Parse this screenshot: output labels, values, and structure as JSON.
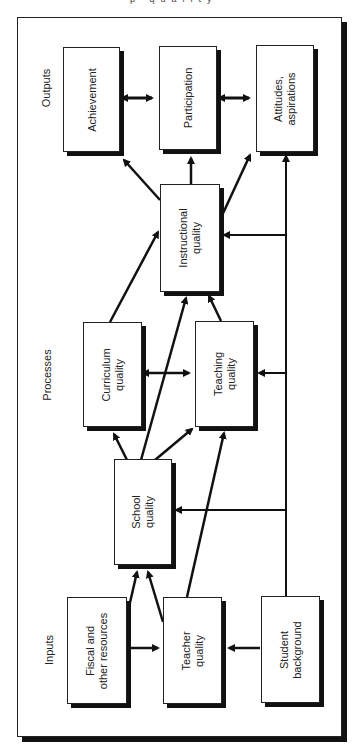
{
  "header": {
    "cropped_caption_fragment": "p      quality"
  },
  "sections": {
    "inputs": "Inputs",
    "processes": "Processes",
    "outputs": "Outputs"
  },
  "nodes": {
    "achievement": "Achievement",
    "participation": "Participation",
    "attitudes_line1": "Attitudes,",
    "attitudes_line2": "aspirations",
    "instructional_line1": "Instructional",
    "instructional_line2": "quality",
    "curriculum_line1": "Curriculum",
    "curriculum_line2": "quality",
    "teaching_line1": "Teaching",
    "teaching_line2": "quality",
    "school_line1": "School",
    "school_line2": "quality",
    "fiscal_line1": "Fiscal and",
    "fiscal_line2": "other resources",
    "teacher_line1": "Teacher",
    "teacher_line2": "quality",
    "student_line1": "Student",
    "student_line2": "background"
  },
  "edges": [
    {
      "from": "Achievement",
      "to": "Participation",
      "type": "bidirectional"
    },
    {
      "from": "Participation",
      "to": "Attitudes, aspirations",
      "type": "bidirectional"
    },
    {
      "from": "Instructional quality",
      "to": "Achievement",
      "type": "directed"
    },
    {
      "from": "Instructional quality",
      "to": "Participation",
      "type": "directed"
    },
    {
      "from": "Instructional quality",
      "to": "Attitudes, aspirations",
      "type": "directed"
    },
    {
      "from": "Curriculum quality",
      "to": "Instructional quality",
      "type": "directed"
    },
    {
      "from": "Teaching quality",
      "to": "Instructional quality",
      "type": "directed"
    },
    {
      "from": "Curriculum quality",
      "to": "Teaching quality",
      "type": "bidirectional"
    },
    {
      "from": "School quality",
      "to": "Curriculum quality",
      "type": "directed"
    },
    {
      "from": "School quality",
      "to": "Teaching quality",
      "type": "directed"
    },
    {
      "from": "School quality",
      "to": "Instructional quality",
      "type": "directed"
    },
    {
      "from": "Fiscal and other resources",
      "to": "School quality",
      "type": "directed"
    },
    {
      "from": "Fiscal and other resources",
      "to": "Teacher quality",
      "type": "directed"
    },
    {
      "from": "Teacher quality",
      "to": "School quality",
      "type": "directed"
    },
    {
      "from": "Teacher quality",
      "to": "Teaching quality",
      "type": "directed"
    },
    {
      "from": "Student background",
      "to": "Teacher quality",
      "type": "directed"
    },
    {
      "from": "Student background",
      "to": "School quality",
      "type": "directed"
    },
    {
      "from": "Student background",
      "to": "Teaching quality",
      "type": "directed"
    },
    {
      "from": "Student background",
      "to": "Instructional quality",
      "type": "directed"
    },
    {
      "from": "Student background",
      "to": "Attitudes, aspirations",
      "type": "directed"
    }
  ],
  "colors": {
    "line": "#111111",
    "box_fill": "#ffffff",
    "text": "#222222"
  }
}
